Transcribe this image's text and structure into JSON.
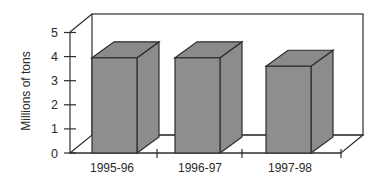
{
  "chart_data": {
    "type": "bar",
    "style": "3d",
    "title": "",
    "xlabel": "",
    "ylabel": "Millions of tons",
    "categories": [
      "1995-96",
      "1996-97",
      "1997-98"
    ],
    "values": [
      3.95,
      3.95,
      3.6
    ],
    "yticks": [
      "0",
      "1",
      "2",
      "3",
      "4",
      "5"
    ],
    "ylim": [
      0,
      5
    ],
    "grid": false,
    "legend": null,
    "colors": {
      "bar_fill": "#8e8e8e",
      "bar_top": "#8a8a8a",
      "bar_side": "#8c8c8c",
      "edge": "#2e2e2e",
      "wall": "#ffffff"
    }
  }
}
